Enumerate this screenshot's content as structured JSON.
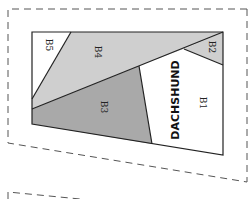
{
  "pattern": {
    "block_title": "DACHSHUND",
    "pieces": [
      {
        "id": "B1",
        "label": "B1",
        "fill": "#ffffff"
      },
      {
        "id": "B2",
        "label": "B2",
        "fill": "#cfcfcf"
      },
      {
        "id": "B3",
        "label": "B3",
        "fill": "#a9a9a9"
      },
      {
        "id": "B4",
        "label": "B4",
        "fill": "#cfcfcf"
      },
      {
        "id": "B5",
        "label": "B5",
        "fill": "#ffffff"
      }
    ]
  },
  "colors": {
    "outline": "#222222",
    "dashed": "#555555",
    "light_gray": "#cfcfcf",
    "dark_gray": "#a9a9a9"
  }
}
